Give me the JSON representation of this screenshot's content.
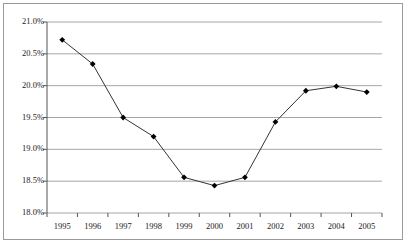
{
  "chart_data": {
    "type": "line",
    "title": "",
    "xlabel": "",
    "ylabel": "",
    "categories": [
      "1995",
      "1996",
      "1997",
      "1998",
      "1999",
      "2000",
      "2001",
      "2002",
      "2003",
      "2004",
      "2005"
    ],
    "values": [
      20.72,
      20.34,
      19.5,
      19.2,
      18.56,
      18.43,
      18.56,
      19.43,
      19.92,
      19.99,
      19.9
    ],
    "ylim": [
      18.0,
      21.0
    ],
    "ytick_values": [
      21.0,
      20.5,
      20.0,
      19.5,
      19.0,
      18.5,
      18.0
    ],
    "ytick_labels": [
      "21.0%",
      "20.5%",
      "20.0%",
      "19.5%",
      "19.0%",
      "18.5%",
      "18.0%"
    ],
    "grid": true,
    "grid_axis": "y",
    "legend": false,
    "legend_position": "none",
    "marker": "diamond",
    "series_color": "#333333",
    "grid_color": "#a6a6a6",
    "axis_color": "#555555",
    "border_color": "#9a9a9a",
    "background_color": "#ffffff"
  }
}
